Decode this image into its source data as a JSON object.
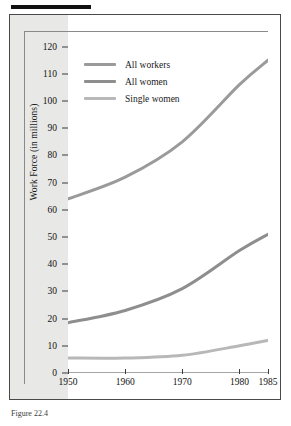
{
  "figure": {
    "caption": "Figure 22.4",
    "top_rule": "black-rule"
  },
  "chart_data": {
    "type": "line",
    "title": "",
    "xlabel": "",
    "ylabel": "Work Force (in millions)",
    "x": [
      1950,
      1960,
      1970,
      1980,
      1985
    ],
    "categories": [
      "1950",
      "1960",
      "1970",
      "1980",
      "1985"
    ],
    "xlim": [
      1950,
      1985
    ],
    "ylim": [
      0,
      125
    ],
    "yticks": [
      0,
      10,
      20,
      30,
      40,
      50,
      60,
      70,
      80,
      90,
      100,
      110,
      120
    ],
    "ytick_labels": [
      "0",
      "10",
      "20",
      "30",
      "40",
      "50",
      "60",
      "70",
      "80",
      "90",
      "100",
      "110",
      "120"
    ],
    "xtick_labels": [
      "1950",
      "1960",
      "1970",
      "1980",
      "1985"
    ],
    "grid": false,
    "legend_position": "upper-left-inside",
    "series": [
      {
        "name": "All workers",
        "values": [
          64,
          72,
          85,
          106,
          115
        ],
        "color": "#9a9a9a"
      },
      {
        "name": "All women",
        "values": [
          18.5,
          23,
          31,
          45,
          51
        ],
        "color": "#8e8e8e"
      },
      {
        "name": "Single women",
        "values": [
          5.5,
          5.5,
          6.5,
          10,
          12
        ],
        "color": "#b8b8b8"
      }
    ]
  },
  "legend": {
    "items": [
      {
        "label": "All workers",
        "color": "#9a9a9a"
      },
      {
        "label": "All women",
        "color": "#8e8e8e"
      },
      {
        "label": "Single women",
        "color": "#b8b8b8"
      }
    ]
  },
  "axis": {
    "y_title": "Work Force (in millions)"
  }
}
